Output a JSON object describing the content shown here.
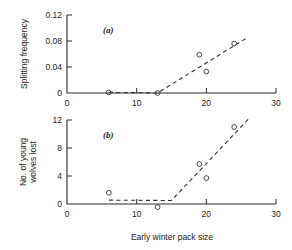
{
  "figure": {
    "xlabel": "Early winter pack size",
    "panel_a_label": "(a)",
    "panel_b_label": "(b)"
  },
  "chart_data": [
    {
      "type": "scatter",
      "panel": "(a)",
      "title": "",
      "xlabel": "Early winter pack size",
      "ylabel": "Splitting frequency",
      "xlim": [
        0,
        30
      ],
      "ylim": [
        0,
        0.12
      ],
      "xticks": [
        0,
        10,
        20,
        30
      ],
      "xticklabels": [
        "0",
        "10",
        "20",
        "30"
      ],
      "yticks": [
        0,
        0.04,
        0.08,
        0.12
      ],
      "yticklabels": [
        "0",
        "0.04",
        "0.08",
        "0.12"
      ],
      "grid": false,
      "legend": "none",
      "points": [
        {
          "x": 6,
          "y": 0.001
        },
        {
          "x": 13,
          "y": 0.0
        },
        {
          "x": 19,
          "y": 0.059
        },
        {
          "x": 20,
          "y": 0.033
        },
        {
          "x": 24,
          "y": 0.076
        }
      ],
      "fit_line": {
        "style": "dashed",
        "vertices": [
          {
            "x": 6,
            "y": 0.001
          },
          {
            "x": 13,
            "y": 0.0
          },
          {
            "x": 26,
            "y": 0.086
          }
        ]
      }
    },
    {
      "type": "scatter",
      "panel": "(b)",
      "title": "",
      "xlabel": "Early winter pack size",
      "ylabel": "No. of young wolves lost",
      "ylabel_lines": [
        "No. of young",
        "wolves lost"
      ],
      "xlim": [
        0,
        30
      ],
      "ylim": [
        0,
        12
      ],
      "xticks": [
        0,
        10,
        20,
        30
      ],
      "xticklabels": [
        "0",
        "10",
        "20",
        "30"
      ],
      "yticks": [
        0,
        4,
        8,
        12
      ],
      "yticklabels": [
        "0",
        "4",
        "8",
        "12"
      ],
      "grid": false,
      "legend": "none",
      "points": [
        {
          "x": 6,
          "y": 1.6
        },
        {
          "x": 13,
          "y": -0.45
        },
        {
          "x": 19,
          "y": 5.7
        },
        {
          "x": 20,
          "y": 3.7
        },
        {
          "x": 24,
          "y": 11.0
        }
      ],
      "fit_line": {
        "style": "dashed",
        "vertices": [
          {
            "x": 6,
            "y": 0.55
          },
          {
            "x": 15,
            "y": 0.5
          },
          {
            "x": 26,
            "y": 12.1
          }
        ]
      }
    }
  ]
}
